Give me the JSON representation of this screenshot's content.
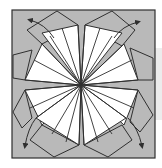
{
  "diagram": {
    "type": "origami-fold-step",
    "colors": {
      "paper_colored": "#b9b9b9",
      "paper_white": "#ffffff",
      "line": "#2f2f2f",
      "side_strip": "#ececec"
    },
    "outer_square": {
      "x": 12,
      "y": 10,
      "w": 143,
      "h": 148
    },
    "center": [
      81,
      85
    ],
    "outer_kites": [
      {
        "name": "top-left",
        "points": "57,11 78,25 42,44 27,30"
      },
      {
        "name": "top-right",
        "points": "112,11 85,25 122,46 135,30"
      },
      {
        "name": "left-top",
        "points": "13,55 32,50 25,80 13,78"
      },
      {
        "name": "left-bottom",
        "points": "13,112 25,90 32,118 22,128"
      },
      {
        "name": "right-top",
        "points": "153,58 130,48 138,80 153,80"
      },
      {
        "name": "right-bottom",
        "points": "153,115 138,90 130,122 140,132"
      },
      {
        "name": "bottom-left",
        "points": "54,157 79,145 42,125 30,140"
      },
      {
        "name": "bottom-right",
        "points": "108,157 84,145 122,125 132,140"
      }
    ],
    "white_sectors": [
      {
        "name": "sector-top-left",
        "points": "81,85 78,25 42,33"
      },
      {
        "name": "sector-left-top",
        "points": "81,85 42,44 25,80"
      },
      {
        "name": "sector-top-right",
        "points": "81,85 85,25 122,33"
      },
      {
        "name": "sector-right-top",
        "points": "81,85 124,44 138,80"
      },
      {
        "name": "sector-left-bottom",
        "points": "81,85 25,90 42,125"
      },
      {
        "name": "sector-bottom-left",
        "points": "81,85 36,118 79,145"
      },
      {
        "name": "sector-right-bottom",
        "points": "81,85 138,90 124,125"
      },
      {
        "name": "sector-bottom-right",
        "points": "81,85 126,118 84,145"
      }
    ],
    "radial_lines": [
      [
        78,
        25
      ],
      [
        62,
        28
      ],
      [
        50,
        36
      ],
      [
        42,
        44
      ],
      [
        34,
        60
      ],
      [
        25,
        80
      ],
      [
        85,
        25
      ],
      [
        100,
        28
      ],
      [
        112,
        36
      ],
      [
        124,
        44
      ],
      [
        132,
        60
      ],
      [
        138,
        80
      ],
      [
        25,
        90
      ],
      [
        30,
        108
      ],
      [
        36,
        118
      ],
      [
        52,
        134
      ],
      [
        66,
        142
      ],
      [
        79,
        145
      ],
      [
        138,
        90
      ],
      [
        134,
        108
      ],
      [
        126,
        118
      ],
      [
        112,
        134
      ],
      [
        98,
        142
      ],
      [
        84,
        145
      ]
    ],
    "arrows": [
      {
        "name": "arrow-top-left",
        "path": "M54,38 Q45,24 30,20",
        "head": [
          30,
          20
        ]
      },
      {
        "name": "arrow-top-right",
        "path": "M114,38 Q122,26 138,22",
        "head": [
          138,
          22
        ]
      },
      {
        "name": "arrow-bottom-left",
        "path": "M36,118 Q28,128 25,146",
        "head": [
          25,
          146
        ]
      },
      {
        "name": "arrow-bottom-right",
        "path": "M128,118 Q138,128 142,146",
        "head": [
          142,
          146
        ]
      }
    ]
  }
}
